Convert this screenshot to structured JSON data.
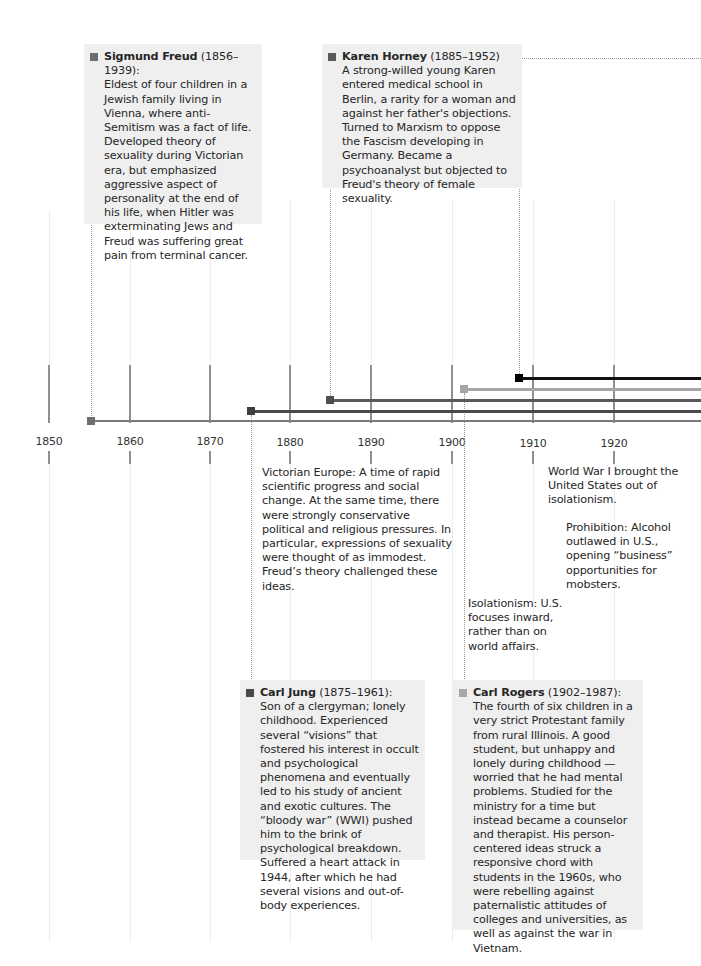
{
  "timeline": {
    "years": [
      {
        "label": "1850",
        "x": 49
      },
      {
        "label": "1860",
        "x": 130
      },
      {
        "label": "1870",
        "x": 210
      },
      {
        "label": "1880",
        "x": 290
      },
      {
        "label": "1890",
        "x": 371
      },
      {
        "label": "1900",
        "x": 452
      },
      {
        "label": "1910",
        "x": 533
      },
      {
        "label": "1920",
        "x": 614
      }
    ],
    "lifelines": [
      {
        "name": "Sigmund Freud",
        "start_year": 1856,
        "marker_x": 91,
        "y": 421,
        "thickness": 2,
        "color": "#7a7a7a"
      },
      {
        "name": "Carl Jung",
        "start_year": 1875,
        "marker_x": 251,
        "y": 411,
        "thickness": 3,
        "color": "#4a4a4a"
      },
      {
        "name": "Karen Horney",
        "start_year": 1885,
        "marker_x": 330,
        "y": 400,
        "thickness": 3,
        "color": "#5a5a5a"
      },
      {
        "name": "Carl Rogers",
        "start_year": 1902,
        "marker_x": 464,
        "y": 389,
        "thickness": 3,
        "color": "#a6a6a6"
      },
      {
        "name": "Unnamed figure (offscreen)",
        "start_year": 1908,
        "marker_x": 519,
        "y": 378,
        "thickness": 3,
        "color": "#111111"
      }
    ]
  },
  "people": {
    "freud": {
      "name": "Sigmund Freud",
      "dates": " (1856–1939):",
      "bio": "Eldest of four children in a Jewish family living in Vienna, where anti-Semitism was a fact of life. Developed theory of sexuality during Victorian era, but emphasized aggressive aspect of personality at the end of his life, when Hitler was exterminating Jews and Freud was suffering great pain from terminal cancer.",
      "marker_color": "#6e6e6e"
    },
    "horney": {
      "name": "Karen Horney",
      "dates": " (1885–1952)",
      "bio": "A strong-willed young Karen entered medical school in Berlin, a rarity for a woman and against her father's objections. Turned to Marxism to oppose the Fascism developing in Germany. Became a psychoanalyst but objected to Freud's theory of female sexuality.",
      "marker_color": "#5a5a5a"
    },
    "jung": {
      "name": "Carl Jung",
      "dates": " (1875–1961):",
      "bio": "Son of a clergyman; lonely childhood. Experienced several “visions” that fostered his interest in occult and psychological phenomena and eventually led to his study of ancient and exotic cultures. The “bloody war” (WWI) pushed him to the brink of psychological breakdown. Suffered a heart attack in 1944, after which he had several visions and out-of-body experiences.",
      "marker_color": "#4a4a4a"
    },
    "rogers": {
      "name": "Carl Rogers",
      "dates": " (1902–1987):",
      "bio": "The fourth of six children in a very strict Protestant family from rural Illinois. A good student, but unhappy and lonely during childhood — worried that he had mental problems. Studied for the ministry for a time but instead became a counselor and therapist. His person-centered ideas struck a responsive chord with students in the 1960s, who were rebelling against paternalistic attitudes of colleges and universities, as well as against the war in Vietnam.",
      "marker_color": "#a6a6a6"
    }
  },
  "context_notes": {
    "victorian": "Victorian Europe: A time of rapid scientific progress and social change. At the same time, there were strongly conservative political and religious pressures. In particular, expressions of sexuality were thought of as immodest. Freud’s theory challenged these ideas.",
    "wwi": "World War I brought the United States out of isolationism.",
    "prohibition": "Prohibition: Alcohol outlawed in U.S., opening “business” opportunities for mobsters.",
    "isolationism": "Isolationism: U.S. focuses inward, rather than on world affairs."
  }
}
